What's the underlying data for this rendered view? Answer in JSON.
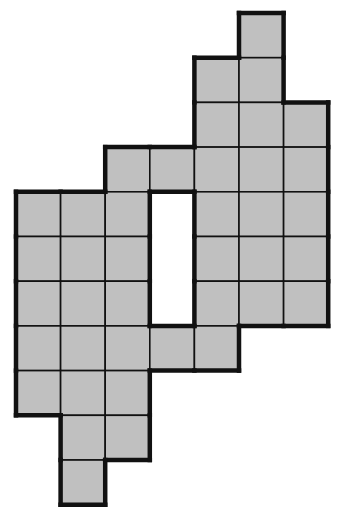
{
  "figure": {
    "grid": {
      "origin_x": 16,
      "origin_y": 13,
      "cell_w": 44.6,
      "cell_h": 44.7,
      "columns": 7,
      "rows": 11
    },
    "colors": {
      "fill": "#c0c0c0",
      "inner_line": "#111111",
      "outer_line": "#111111",
      "background": "#ffffff"
    },
    "cells": [
      [
        0,
        5
      ],
      [
        1,
        4
      ],
      [
        1,
        5
      ],
      [
        2,
        4
      ],
      [
        2,
        5
      ],
      [
        2,
        6
      ],
      [
        3,
        2
      ],
      [
        3,
        3
      ],
      [
        3,
        4
      ],
      [
        3,
        5
      ],
      [
        3,
        6
      ],
      [
        4,
        0
      ],
      [
        4,
        1
      ],
      [
        4,
        2
      ],
      [
        4,
        4
      ],
      [
        4,
        5
      ],
      [
        4,
        6
      ],
      [
        5,
        0
      ],
      [
        5,
        1
      ],
      [
        5,
        2
      ],
      [
        5,
        4
      ],
      [
        5,
        5
      ],
      [
        5,
        6
      ],
      [
        6,
        0
      ],
      [
        6,
        1
      ],
      [
        6,
        2
      ],
      [
        6,
        4
      ],
      [
        6,
        5
      ],
      [
        6,
        6
      ],
      [
        7,
        0
      ],
      [
        7,
        1
      ],
      [
        7,
        2
      ],
      [
        7,
        3
      ],
      [
        7,
        4
      ],
      [
        8,
        0
      ],
      [
        8,
        1
      ],
      [
        8,
        2
      ],
      [
        9,
        1
      ],
      [
        9,
        2
      ],
      [
        10,
        1
      ]
    ],
    "hole": {
      "rows": [
        4,
        5,
        6
      ],
      "col": 3
    },
    "cell_count": 40
  }
}
